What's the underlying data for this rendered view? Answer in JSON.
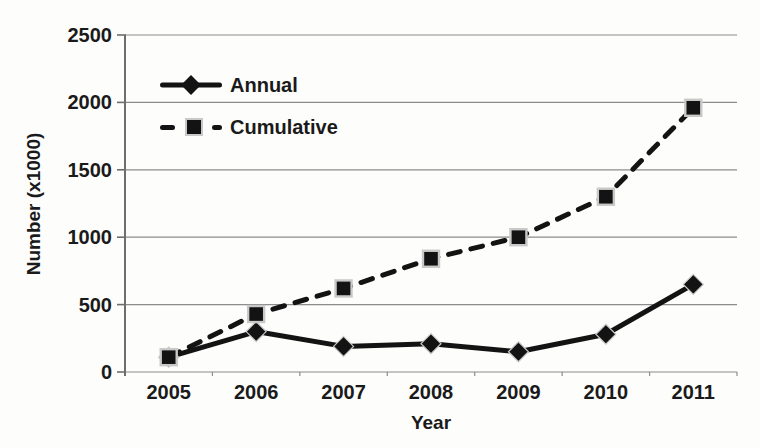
{
  "chart_data": {
    "type": "line",
    "title": "",
    "xlabel": "Year",
    "ylabel": "Number (x1000)",
    "categories": [
      "2005",
      "2006",
      "2007",
      "2008",
      "2009",
      "2010",
      "2011"
    ],
    "series": [
      {
        "name": "Annual",
        "line_style": "solid",
        "marker": "diamond",
        "values": [
          110,
          300,
          190,
          210,
          150,
          280,
          650
        ]
      },
      {
        "name": "Cumulative",
        "line_style": "dashed",
        "marker": "square",
        "values": [
          110,
          430,
          620,
          840,
          1000,
          1300,
          1960
        ]
      }
    ],
    "ylim": [
      0,
      2500
    ],
    "yticks": [
      0,
      500,
      1000,
      1500,
      2000,
      2500
    ],
    "grid": "horizontal",
    "legend_position": "upper-left-inside"
  },
  "colors": {
    "series": "#131313",
    "text": "#1a1a1a",
    "gridline": "#8c8c8c",
    "axis": "#6e6e6e",
    "marker_halo": "#c9c9c9",
    "background": "#fdfdfc"
  }
}
